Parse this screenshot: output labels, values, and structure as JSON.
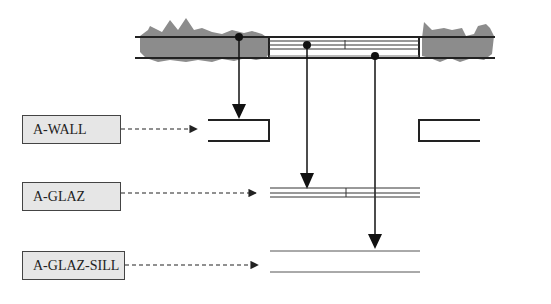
{
  "diagram": {
    "type": "cad-layer-mapping",
    "colors": {
      "line": "#222222",
      "hatch": "#8c8c8c",
      "box_fill": "#e6e6e6",
      "box_border": "#444444"
    },
    "plan": {
      "elements": [
        "wall-left",
        "window-glazing",
        "sill",
        "wall-right"
      ],
      "mullion_count": 1
    },
    "layers": [
      {
        "id": "wall",
        "label": "A-WALL",
        "target": "wall sections"
      },
      {
        "id": "glaz",
        "label": "A-GLAZ",
        "target": "glazing lines"
      },
      {
        "id": "glaz_sill",
        "label": "A-GLAZ-SILL",
        "target": "sill lines"
      }
    ]
  }
}
